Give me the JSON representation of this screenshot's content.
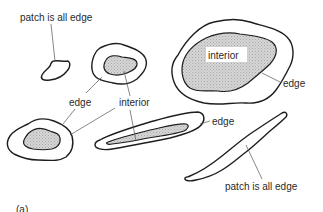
{
  "figure": {
    "panel_label": "(a)",
    "labels": {
      "patch_all_edge_top": "patch is all edge",
      "interior_large": "interior",
      "edge_large": "edge",
      "edge_middle": "edge",
      "interior_middle": "interior",
      "edge_elongated": "edge",
      "patch_all_edge_bottom": "patch is all edge"
    },
    "colors": {
      "line": "#1e1e1e",
      "interior_fill": "#cfcfcf",
      "background": "#ffffff"
    }
  }
}
